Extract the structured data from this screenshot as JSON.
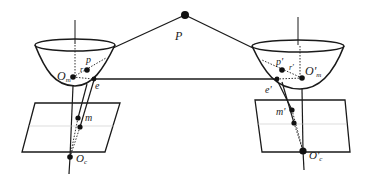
{
  "figure": {
    "type": "catadioptric-stereo-epipolar-geometry",
    "colors": {
      "ink": "#1a1a1a",
      "background": "#ffffff"
    }
  },
  "labels": {
    "world_point": "P",
    "left": {
      "mirror_focus": "O",
      "mirror_focus_sub": "m",
      "mirror_point": "p",
      "ray_vector": "r",
      "epipole": "e",
      "image_point": "m",
      "camera_center": "O",
      "camera_center_sub": "c"
    },
    "right": {
      "mirror_focus": "O'",
      "mirror_focus_sub": "m",
      "mirror_point": "p'",
      "ray_vector": "r'",
      "epipole": "e'",
      "image_point": "m'",
      "camera_center": "O'",
      "camera_center_sub": "c"
    }
  }
}
